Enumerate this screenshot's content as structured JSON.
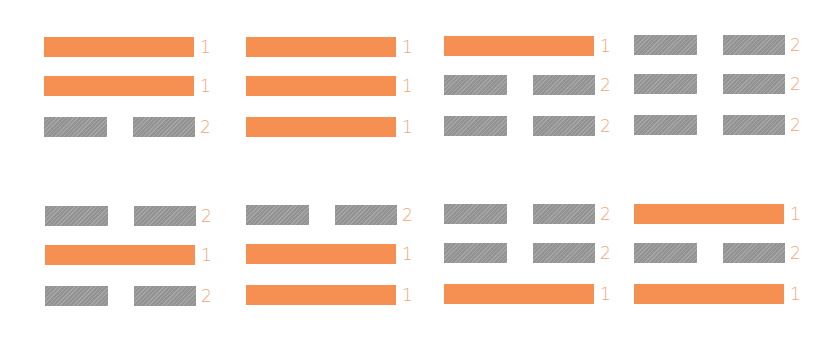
{
  "colors": {
    "yang": "#f58f52",
    "yin": "#9c9c9c",
    "label": "#f5a57c",
    "background": "#ffffff"
  },
  "legend": {
    "yang_value": "1",
    "yin_value": "2"
  },
  "trigrams": [
    {
      "lines": [
        {
          "type": "yang",
          "value": "1"
        },
        {
          "type": "yang",
          "value": "1"
        },
        {
          "type": "yin",
          "value": "2"
        }
      ]
    },
    {
      "lines": [
        {
          "type": "yang",
          "value": "1"
        },
        {
          "type": "yang",
          "value": "1"
        },
        {
          "type": "yang",
          "value": "1"
        }
      ]
    },
    {
      "lines": [
        {
          "type": "yang",
          "value": "1"
        },
        {
          "type": "yin",
          "value": "2"
        },
        {
          "type": "yin",
          "value": "2"
        }
      ]
    },
    {
      "lines": [
        {
          "type": "yin",
          "value": "2"
        },
        {
          "type": "yin",
          "value": "2"
        },
        {
          "type": "yin",
          "value": "2"
        }
      ]
    },
    {
      "lines": [
        {
          "type": "yin",
          "value": "2"
        },
        {
          "type": "yang",
          "value": "1"
        },
        {
          "type": "yin",
          "value": "2"
        }
      ]
    },
    {
      "lines": [
        {
          "type": "yin",
          "value": "2"
        },
        {
          "type": "yang",
          "value": "1"
        },
        {
          "type": "yang",
          "value": "1"
        }
      ]
    },
    {
      "lines": [
        {
          "type": "yin",
          "value": "2"
        },
        {
          "type": "yin",
          "value": "2"
        },
        {
          "type": "yang",
          "value": "1"
        }
      ]
    },
    {
      "lines": [
        {
          "type": "yang",
          "value": "1"
        },
        {
          "type": "yin",
          "value": "2"
        },
        {
          "type": "yang",
          "value": "1"
        }
      ]
    }
  ]
}
